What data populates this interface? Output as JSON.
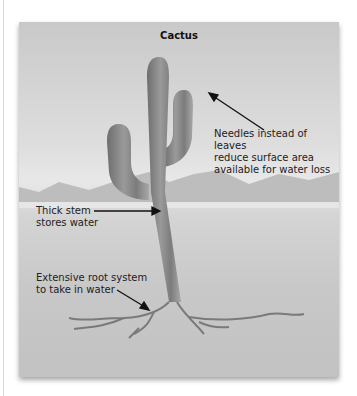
{
  "diagram": {
    "title": "Cactus",
    "labels": {
      "needles": [
        "Needles instead of leaves",
        "reduce surface area",
        "available for water loss"
      ],
      "stem": [
        "Thick stem",
        "stores water"
      ],
      "roots": [
        "Extensive root system",
        "to take in water"
      ]
    },
    "colors": {
      "background": "#d4d4d4",
      "cactus": "#8a8a8a",
      "text": "#222222",
      "arrow": "#111111"
    }
  }
}
